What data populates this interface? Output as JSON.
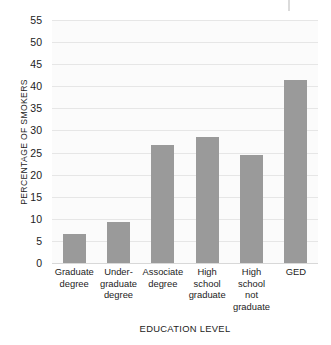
{
  "chart_data": {
    "type": "bar",
    "title": "",
    "xlabel": "EDUCATION LEVEL",
    "ylabel": "PERCENTAGE OF SMOKERS",
    "categories": [
      "Graduate degree",
      "Under- graduate degree",
      "Associate degree",
      "High school graduate",
      "High school not graduate",
      "GED"
    ],
    "category_lines": [
      [
        "Graduate",
        "degree"
      ],
      [
        "Under-",
        "graduate",
        "degree"
      ],
      [
        "Associate",
        "degree"
      ],
      [
        "High",
        "school",
        "graduate"
      ],
      [
        "High",
        "school",
        "not",
        "graduate"
      ],
      [
        "GED"
      ]
    ],
    "values": [
      6.5,
      9.2,
      26.6,
      28.5,
      24.4,
      41.5
    ],
    "ylim": [
      0,
      55
    ],
    "yticks": [
      0,
      5,
      10,
      15,
      20,
      25,
      30,
      35,
      40,
      45,
      50,
      55
    ],
    "ytick_labels": [
      "0",
      "5",
      "10",
      "15",
      "20",
      "25",
      "30",
      "35",
      "40",
      "45",
      "50",
      "55"
    ],
    "grid": true,
    "legend": false,
    "bar_color": "#9a9a9a",
    "plot_background": "#fbfbfb",
    "gridline_color": "#e6e6e6"
  }
}
